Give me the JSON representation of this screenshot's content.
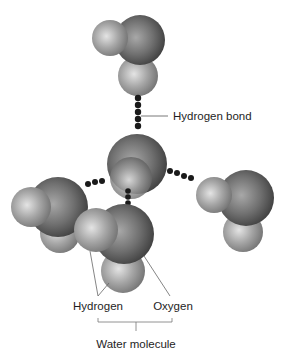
{
  "diagram": {
    "type": "water-hydrogen-bonding",
    "labels": {
      "hydrogen_bond": "Hydrogen bond",
      "hydrogen": "Hydrogen",
      "oxygen": "Oxygen",
      "water_molecule": "Water molecule"
    },
    "colors": {
      "oxygen_dark": "#3c3c3c",
      "oxygen_light": "#a8a8a8",
      "hydrogen_dark": "#6e6e6e",
      "hydrogen_light": "#dcdcdc",
      "bond_dot": "#1a1a1a",
      "leader_line": "#555555",
      "text": "#1e1e1e"
    },
    "molecules": [
      {
        "name": "top",
        "oxygen": [
          140,
          40,
          25
        ],
        "hydrogens": [
          [
            110,
            38,
            18
          ],
          [
            138,
            76,
            20
          ]
        ]
      },
      {
        "name": "center",
        "oxygen": [
          137,
          163,
          30
        ],
        "hydrogens": [
          [
            130,
            180,
            22
          ]
        ]
      },
      {
        "name": "left",
        "oxygen": [
          58,
          208,
          30
        ],
        "hydrogens": [
          [
            31,
            207,
            20
          ],
          [
            60,
            233,
            20
          ]
        ]
      },
      {
        "name": "right",
        "oxygen": [
          246,
          198,
          28
        ],
        "hydrogens": [
          [
            214,
            195,
            18
          ],
          [
            243,
            232,
            20
          ]
        ]
      },
      {
        "name": "front",
        "oxygen": [
          124,
          234,
          30
        ],
        "hydrogens": [
          [
            96,
            230,
            22
          ],
          [
            123,
            271,
            22
          ]
        ]
      }
    ],
    "hydrogen_bonds": [
      {
        "name": "top-center",
        "dots": [
          [
            138,
            98
          ],
          [
            138,
            106
          ],
          [
            138,
            113
          ],
          [
            138,
            120
          ],
          [
            138,
            127
          ]
        ]
      },
      {
        "name": "left-center",
        "dots": [
          [
            89,
            186
          ],
          [
            96,
            184
          ],
          [
            103,
            183
          ]
        ]
      },
      {
        "name": "right-center",
        "dots": [
          [
            168,
            171
          ],
          [
            175,
            174
          ],
          [
            182,
            176
          ],
          [
            189,
            178
          ]
        ]
      },
      {
        "name": "front-center",
        "dots": [
          [
            128,
            188
          ],
          [
            128,
            194
          ],
          [
            128,
            200
          ]
        ]
      }
    ]
  }
}
